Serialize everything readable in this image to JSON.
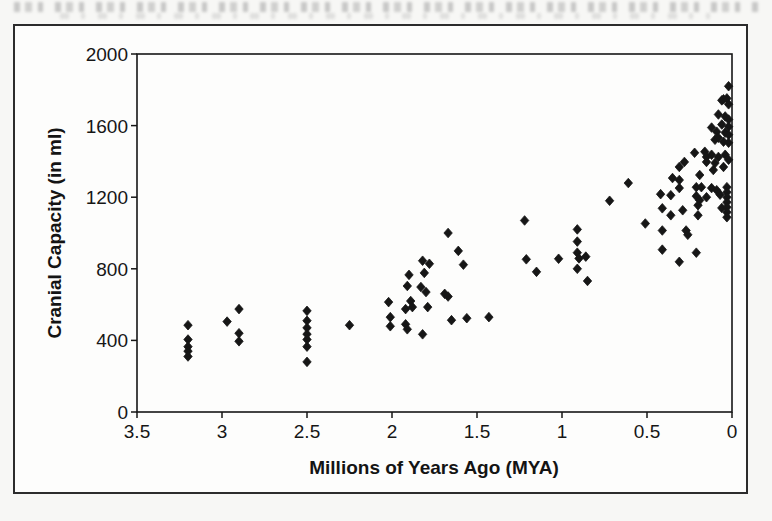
{
  "chart_data": {
    "type": "scatter",
    "title": "",
    "xlabel": "Millions of Years Ago (MYA)",
    "ylabel": "Cranial Capacity (in ml)",
    "x_tick_values": [
      3.5,
      3,
      2.5,
      2,
      1.5,
      1,
      0.5,
      0
    ],
    "x_tick_labels": [
      "3.5",
      "3",
      "2.5",
      "2",
      "1.5",
      "1",
      "0.5",
      "0"
    ],
    "y_tick_values": [
      0,
      400,
      800,
      1200,
      1600,
      2000
    ],
    "y_tick_labels": [
      "0",
      "400",
      "800",
      "1200",
      "1600",
      "2000"
    ],
    "xlim": [
      3.5,
      0
    ],
    "x_axis_reversed": true,
    "ylim": [
      0,
      2000
    ],
    "grid": false,
    "legend_position": "none",
    "marker": "diamond",
    "ink_color": "#161616",
    "points": [
      [
        3.2,
        485
      ],
      [
        3.2,
        405
      ],
      [
        3.2,
        365
      ],
      [
        3.2,
        340
      ],
      [
        3.2,
        310
      ],
      [
        2.97,
        505
      ],
      [
        2.9,
        575
      ],
      [
        2.9,
        440
      ],
      [
        2.9,
        395
      ],
      [
        2.5,
        565
      ],
      [
        2.5,
        510
      ],
      [
        2.5,
        470
      ],
      [
        2.5,
        435
      ],
      [
        2.5,
        405
      ],
      [
        2.5,
        365
      ],
      [
        2.5,
        280
      ],
      [
        2.25,
        485
      ],
      [
        2.02,
        614
      ],
      [
        2.01,
        530
      ],
      [
        2.01,
        479
      ],
      [
        1.92,
        575
      ],
      [
        1.92,
        490
      ],
      [
        1.91,
        704
      ],
      [
        1.91,
        462
      ],
      [
        1.9,
        766
      ],
      [
        1.89,
        620
      ],
      [
        1.88,
        586
      ],
      [
        1.82,
        434
      ],
      [
        1.83,
        698
      ],
      [
        1.82,
        845
      ],
      [
        1.81,
        777
      ],
      [
        1.8,
        670
      ],
      [
        1.79,
        586
      ],
      [
        1.78,
        828
      ],
      [
        1.69,
        660
      ],
      [
        1.67,
        645
      ],
      [
        1.67,
        1000
      ],
      [
        1.65,
        513
      ],
      [
        1.61,
        900
      ],
      [
        1.58,
        823
      ],
      [
        1.56,
        524
      ],
      [
        1.43,
        530
      ],
      [
        1.22,
        1070
      ],
      [
        1.21,
        853
      ],
      [
        1.15,
        783
      ],
      [
        1.02,
        856
      ],
      [
        0.91,
        1020
      ],
      [
        0.91,
        952
      ],
      [
        0.91,
        890
      ],
      [
        0.9,
        858
      ],
      [
        0.86,
        868
      ],
      [
        0.91,
        800
      ],
      [
        0.85,
        732
      ],
      [
        0.72,
        1180
      ],
      [
        0.61,
        1279
      ],
      [
        0.51,
        1053
      ],
      [
        0.42,
        1217
      ],
      [
        0.41,
        1138
      ],
      [
        0.41,
        1014
      ],
      [
        0.41,
        907
      ],
      [
        0.36,
        1211
      ],
      [
        0.36,
        1099
      ],
      [
        0.35,
        1307
      ],
      [
        0.31,
        1369
      ],
      [
        0.31,
        1296
      ],
      [
        0.31,
        1251
      ],
      [
        0.29,
        1127
      ],
      [
        0.31,
        839
      ],
      [
        0.28,
        1397
      ],
      [
        0.27,
        1014
      ],
      [
        0.26,
        990
      ],
      [
        0.22,
        1448
      ],
      [
        0.21,
        1256
      ],
      [
        0.21,
        1206
      ],
      [
        0.2,
        1155
      ],
      [
        0.19,
        1183
      ],
      [
        0.2,
        1099
      ],
      [
        0.21,
        890
      ],
      [
        0.16,
        1454
      ],
      [
        0.15,
        1425
      ],
      [
        0.15,
        1397
      ],
      [
        0.15,
        1200
      ],
      [
        0.18,
        1256
      ],
      [
        0.19,
        1324
      ],
      [
        0.12,
        1589
      ],
      [
        0.12,
        1437
      ],
      [
        0.12,
        1251
      ],
      [
        0.11,
        1352
      ],
      [
        0.1,
        1521
      ],
      [
        0.1,
        1391
      ],
      [
        0.09,
        1566
      ],
      [
        0.09,
        1239
      ],
      [
        0.08,
        1662
      ],
      [
        0.08,
        1532
      ],
      [
        0.08,
        1425
      ],
      [
        0.06,
        1741
      ],
      [
        0.06,
        1606
      ],
      [
        0.05,
        1747
      ],
      [
        0.05,
        1510
      ],
      [
        0.05,
        1369
      ],
      [
        0.07,
        1214
      ],
      [
        0.06,
        1140
      ],
      [
        0.03,
        1256
      ],
      [
        0.03,
        1228
      ],
      [
        0.03,
        1200
      ],
      [
        0.03,
        1172
      ],
      [
        0.03,
        1144
      ],
      [
        0.03,
        1116
      ],
      [
        0.03,
        1088
      ],
      [
        0.02,
        1820
      ],
      [
        0.03,
        1752
      ],
      [
        0.02,
        1719
      ],
      [
        0.04,
        1651
      ],
      [
        0.02,
        1634
      ],
      [
        0.02,
        1594
      ],
      [
        0.04,
        1561
      ],
      [
        0.02,
        1549
      ],
      [
        0.02,
        1504
      ],
      [
        0.04,
        1437
      ],
      [
        0.02,
        1409
      ]
    ]
  }
}
